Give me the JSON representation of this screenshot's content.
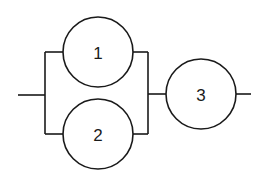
{
  "diagram": {
    "type": "reliability-block-diagram",
    "nodes": [
      {
        "id": "1",
        "label": "1"
      },
      {
        "id": "2",
        "label": "2"
      },
      {
        "id": "3",
        "label": "3"
      }
    ],
    "connections": [
      {
        "from": "input",
        "to": "1"
      },
      {
        "from": "input",
        "to": "2"
      },
      {
        "from": "1",
        "to": "3"
      },
      {
        "from": "2",
        "to": "3"
      },
      {
        "from": "3",
        "to": "output"
      }
    ]
  }
}
